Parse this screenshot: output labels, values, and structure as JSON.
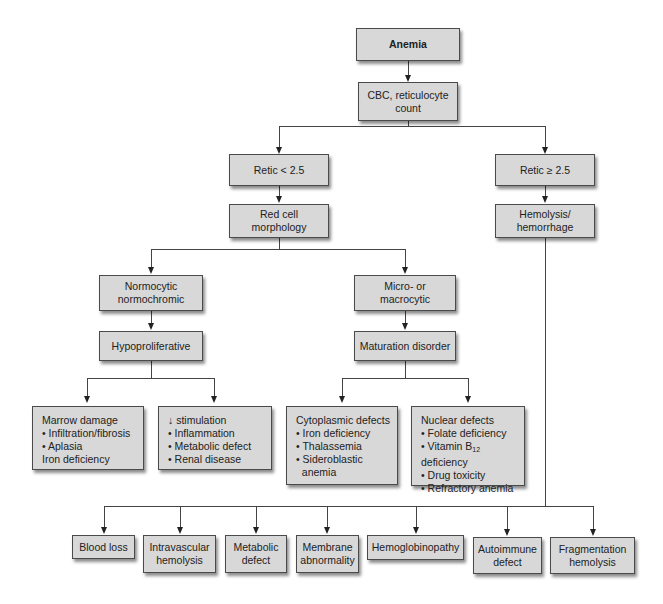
{
  "diagram": {
    "nodes": {
      "anemia": "Anemia",
      "cbc": "CBC, reticulocyte\ncount",
      "retic_low": "Retic < 2.5",
      "retic_high": "Retic ≥ 2.5",
      "red_cell": "Red cell\nmorphology",
      "hemolysis": "Hemolysis/\nhemorrhage",
      "normocytic": "Normocytic\nnormochromic",
      "micro_macro": "Micro- or\nmacrocytic",
      "hypoproliferative": "Hypoproliferative",
      "maturation": "Maturation disorder"
    },
    "marrow": {
      "title": "Marrow damage",
      "items": [
        "• Infiltration/fibrosis",
        "• Aplasia"
      ],
      "footer": "Iron deficiency"
    },
    "stimulation": {
      "title": "↓ stimulation",
      "items": [
        "• Inflammation",
        "• Metabolic defect",
        "• Renal disease"
      ]
    },
    "cytoplasmic": {
      "title": "Cytoplasmic defects",
      "items": [
        "• Iron deficiency",
        "• Thalassemia",
        "• Sideroblastic",
        "  anemia"
      ]
    },
    "nuclear": {
      "title": "Nuclear defects",
      "items": [
        "• Folate deficiency",
        "• Vitamin B",
        "12",
        " deficiency",
        "• Drug toxicity",
        "• Refractory anemia"
      ]
    },
    "bottom": [
      "Blood loss",
      "Intravascular\nhemolysis",
      "Metabolic\ndefect",
      "Membrane\nabnormality",
      "Hemoglobinopathy",
      "Autoimmune\ndefect",
      "Fragmentation\nhemolysis"
    ]
  }
}
